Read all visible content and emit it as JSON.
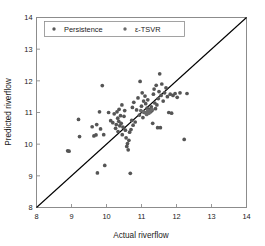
{
  "chart_data": {
    "type": "scatter",
    "title": "",
    "xlabel": "Actual riverflow",
    "ylabel": "Predicted riverflow",
    "xlim": [
      8,
      14
    ],
    "ylim": [
      8,
      14
    ],
    "xticks": [
      8,
      9,
      10,
      11,
      12,
      13,
      14
    ],
    "yticks": [
      8,
      9,
      10,
      11,
      12,
      13,
      14
    ],
    "xticklabels": [
      "8",
      "9",
      "10",
      "11",
      "12",
      "13",
      "14"
    ],
    "yticklabels": [
      "8",
      "9",
      "10",
      "11",
      "12",
      "13",
      "14"
    ],
    "grid": false,
    "legend_position": "upper left",
    "legend": [
      {
        "name": "Persistence",
        "marker": "dot",
        "color": "#555555"
      },
      {
        "name": "ε-TSVR",
        "marker": "dot",
        "color": "#6b6b6b"
      }
    ],
    "reference_line": {
      "name": "identity-line",
      "from": [
        8,
        8
      ],
      "to": [
        14,
        14
      ],
      "color": "#000000"
    },
    "marker_color": "#585858",
    "marker_size": 3,
    "series": [
      {
        "name": "Persistence",
        "color": "#555555",
        "points": [
          [
            8.89,
            9.79
          ],
          [
            8.93,
            9.78
          ],
          [
            9.2,
            10.78
          ],
          [
            9.23,
            10.24
          ],
          [
            9.59,
            10.55
          ],
          [
            9.64,
            10.26
          ],
          [
            9.7,
            10.29
          ],
          [
            9.72,
            10.62
          ],
          [
            9.74,
            9.09
          ],
          [
            9.8,
            11.02
          ],
          [
            9.83,
            10.48
          ],
          [
            9.88,
            11.85
          ],
          [
            9.92,
            10.3
          ],
          [
            9.95,
            9.33
          ],
          [
            10.06,
            11.0
          ],
          [
            10.12,
            10.74
          ],
          [
            10.18,
            10.68
          ],
          [
            10.22,
            10.96
          ],
          [
            10.26,
            10.5
          ],
          [
            10.28,
            10.62
          ],
          [
            10.3,
            11.02
          ],
          [
            10.32,
            10.82
          ],
          [
            10.33,
            10.4
          ],
          [
            10.35,
            10.72
          ],
          [
            10.36,
            11.1
          ],
          [
            10.38,
            10.58
          ],
          [
            10.4,
            10.9
          ],
          [
            10.42,
            10.66
          ],
          [
            10.44,
            11.24
          ],
          [
            10.45,
            10.3
          ],
          [
            10.47,
            10.54
          ],
          [
            10.5,
            10.88
          ],
          [
            10.52,
            11.06
          ],
          [
            10.54,
            10.44
          ],
          [
            10.56,
            10.2
          ],
          [
            10.58,
            9.93
          ],
          [
            10.6,
            10.02
          ],
          [
            10.62,
            9.82
          ],
          [
            10.64,
            10.12
          ],
          [
            10.66,
            10.38
          ],
          [
            10.68,
            9.08
          ],
          [
            10.7,
            10.46
          ],
          [
            10.72,
            10.75
          ],
          [
            10.74,
            11.16
          ],
          [
            10.76,
            10.6
          ],
          [
            10.78,
            11.32
          ],
          [
            10.82,
            10.7
          ],
          [
            10.86,
            11.08
          ],
          [
            10.9,
            11.46
          ],
          [
            10.94,
            10.92
          ],
          [
            10.96,
            11.98
          ],
          [
            11.0,
            11.2
          ],
          [
            11.02,
            11.62
          ],
          [
            11.04,
            10.84
          ],
          [
            11.06,
            11.36
          ],
          [
            11.08,
            11.0
          ],
          [
            11.1,
            11.52
          ],
          [
            11.12,
            11.28
          ],
          [
            11.14,
            10.96
          ],
          [
            11.16,
            11.14
          ],
          [
            11.18,
            11.4
          ],
          [
            11.2,
            11.04
          ],
          [
            11.22,
            11.1
          ],
          [
            11.24,
            11.08
          ],
          [
            11.26,
            11.02
          ],
          [
            11.28,
            11.18
          ],
          [
            11.3,
            11.06
          ],
          [
            11.32,
            10.66
          ],
          [
            11.34,
            11.58
          ],
          [
            11.36,
            11.74
          ],
          [
            11.38,
            11.3
          ],
          [
            11.4,
            11.12
          ],
          [
            11.42,
            11.86
          ],
          [
            11.44,
            11.24
          ],
          [
            11.46,
            10.52
          ],
          [
            11.48,
            11.44
          ],
          [
            11.5,
            11.66
          ],
          [
            11.52,
            12.22
          ],
          [
            11.54,
            10.52
          ],
          [
            11.56,
            11.54
          ],
          [
            11.58,
            11.9
          ],
          [
            11.62,
            11.36
          ],
          [
            11.66,
            11.62
          ],
          [
            11.7,
            11.78
          ],
          [
            11.74,
            11.5
          ],
          [
            11.78,
            11.0
          ],
          [
            11.82,
            11.58
          ],
          [
            11.86,
            10.98
          ],
          [
            11.9,
            11.54
          ],
          [
            11.96,
            11.6
          ],
          [
            12.02,
            11.48
          ],
          [
            12.1,
            11.62
          ],
          [
            12.22,
            10.15
          ],
          [
            12.3,
            11.6
          ]
        ]
      },
      {
        "name": "ε-TSVR",
        "color": "#6b6b6b",
        "points": [
          [
            10.98,
            11.06
          ],
          [
            11.05,
            11.02
          ],
          [
            11.12,
            11.0
          ],
          [
            11.18,
            11.06
          ],
          [
            11.24,
            11.04
          ],
          [
            11.3,
            11.1
          ],
          [
            11.15,
            10.94
          ],
          [
            11.21,
            10.98
          ]
        ]
      }
    ]
  },
  "axes": {
    "x_axis_name": "actual-riverflow-axis",
    "y_axis_name": "predicted-riverflow-axis"
  }
}
